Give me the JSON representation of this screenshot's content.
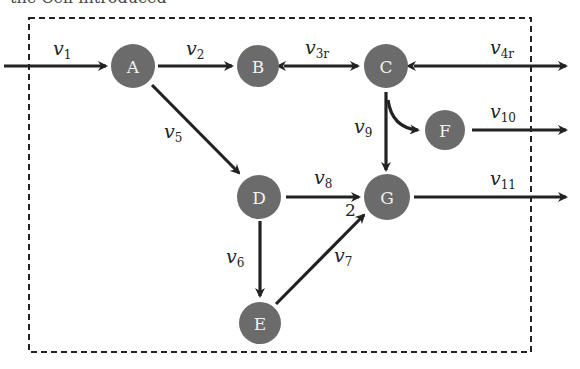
{
  "header_fragment": "the Cell introduced",
  "diagram": {
    "type": "metabolic-network",
    "boundary": {
      "style": "dashed",
      "x": 29,
      "y": 18,
      "width": 502,
      "height": 334
    },
    "nodes": [
      {
        "id": "A",
        "label": "A",
        "x": 133,
        "y": 66
      },
      {
        "id": "B",
        "label": "B",
        "x": 258,
        "y": 66
      },
      {
        "id": "C",
        "label": "C",
        "x": 386,
        "y": 66
      },
      {
        "id": "F",
        "label": "F",
        "x": 445,
        "y": 130
      },
      {
        "id": "D",
        "label": "D",
        "x": 259,
        "y": 197
      },
      {
        "id": "G",
        "label": "G",
        "x": 387,
        "y": 197
      },
      {
        "id": "E",
        "label": "E",
        "x": 260,
        "y": 323
      }
    ],
    "fluxes": [
      {
        "id": "v1",
        "symbol": "v",
        "sub": "1",
        "from": "external",
        "to": "A",
        "reversible": false
      },
      {
        "id": "v2",
        "symbol": "v",
        "sub": "2",
        "from": "A",
        "to": "B",
        "reversible": false
      },
      {
        "id": "v3r",
        "symbol": "v",
        "sub": "3r",
        "from": "B",
        "to": "C",
        "reversible": true
      },
      {
        "id": "v4r",
        "symbol": "v",
        "sub": "4r",
        "from": "C",
        "to": "external",
        "reversible": true
      },
      {
        "id": "v5",
        "symbol": "v",
        "sub": "5",
        "from": "A",
        "to": "D",
        "reversible": false
      },
      {
        "id": "v6",
        "symbol": "v",
        "sub": "6",
        "from": "D",
        "to": "E",
        "reversible": false
      },
      {
        "id": "v7",
        "symbol": "v",
        "sub": "7",
        "from": "E",
        "to": "G",
        "reversible": false,
        "stoichiometry": "2"
      },
      {
        "id": "v8",
        "symbol": "v",
        "sub": "8",
        "from": "D",
        "to": "G",
        "reversible": false
      },
      {
        "id": "v9",
        "symbol": "v",
        "sub": "9",
        "from": "C",
        "to": [
          "G",
          "F"
        ],
        "reversible": false
      },
      {
        "id": "v10",
        "symbol": "v",
        "sub": "10",
        "from": "F",
        "to": "external",
        "reversible": false
      },
      {
        "id": "v11",
        "symbol": "v",
        "sub": "11",
        "from": "G",
        "to": "external",
        "reversible": false
      }
    ],
    "stoichiometry_label": "2",
    "colors": {
      "node": "#6b6b6b",
      "node_text": "#f2f2f2",
      "edge": "#222222",
      "background": "#ffffff"
    }
  }
}
